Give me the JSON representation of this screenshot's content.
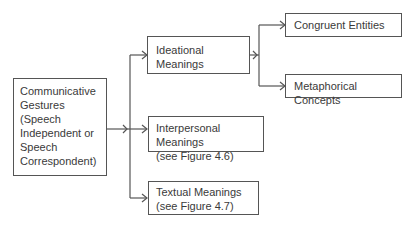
{
  "diagram": {
    "root": {
      "lines": [
        "Communicative",
        "Gestures",
        "(Speech",
        "Independent or",
        "Speech",
        "Correspondent)"
      ]
    },
    "ideational": {
      "label": "Ideational Meanings"
    },
    "interpersonal": {
      "lines": [
        "Interpersonal Meanings",
        "(see Figure 4.6)"
      ]
    },
    "textual": {
      "lines": [
        "Textual Meanings",
        "(see Figure 4.7)"
      ]
    },
    "congruent": {
      "label": "Congruent Entities"
    },
    "metaphorical": {
      "label": "Metaphorical Concepts"
    },
    "colors": {
      "line": "#555555",
      "text": "#3a3a3a",
      "background": "#ffffff"
    }
  }
}
